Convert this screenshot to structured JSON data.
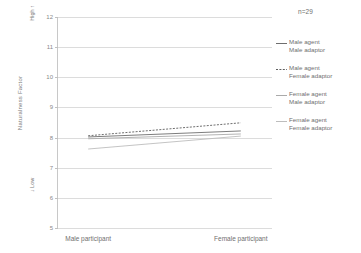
{
  "chart_data": {
    "type": "line",
    "title": "",
    "xlabel": "",
    "ylabel": "Naturalness Factor",
    "ylim": [
      5,
      12
    ],
    "ytick_labels": [
      "12",
      "11",
      "10",
      "9",
      "8",
      "7",
      "6",
      "5"
    ],
    "ytick_values": [
      12,
      11,
      10,
      9,
      8,
      7,
      6,
      5
    ],
    "grid": true,
    "legend_position": "right",
    "categories": [
      "Male participant",
      "Female participant"
    ],
    "x": [
      0,
      1
    ],
    "axis_high_label": "High",
    "axis_high_arrow": "↑",
    "axis_low_label": "Low",
    "axis_low_arrow": "↓",
    "annotation": "n=29",
    "series": [
      {
        "name": "Male agent Male adaptor",
        "label_line1": "Male agent",
        "label_line2": "Male adaptor",
        "values": [
          8.02,
          8.22
        ],
        "color": "#6e6e6e",
        "dash": "none",
        "width": 0.9
      },
      {
        "name": "Male agent Female adaptor",
        "label_line1": "Male agent",
        "label_line2": "Female adaptor",
        "values": [
          8.06,
          8.49
        ],
        "color": "#5e5e5e",
        "dash": "2,1.4",
        "width": 0.9
      },
      {
        "name": "Female agent Male adaptor",
        "label_line1": "Female agent",
        "label_line2": "Male adaptor",
        "values": [
          7.96,
          8.12
        ],
        "color": "#aaaaaa",
        "dash": "none",
        "width": 0.9
      },
      {
        "name": "Female agent Female adaptor",
        "label_line1": "Female agent",
        "label_line2": "Female adaptor",
        "values": [
          7.62,
          8.05
        ],
        "color": "#bdbdbd",
        "dash": "none",
        "width": 0.9
      }
    ]
  }
}
